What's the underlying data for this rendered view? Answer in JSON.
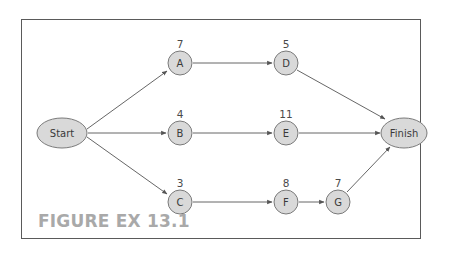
{
  "figure": {
    "caption": "FIGURE EX 13.1",
    "colors": {
      "node_fill": "#d9d9d9",
      "node_stroke": "#7a7a7a",
      "edge": "#555555",
      "caption": "#a9a9a9",
      "frame": "#5a5a5a"
    }
  },
  "nodes": [
    {
      "id": "start",
      "label": "Start",
      "shape": "ellipse",
      "duration": null
    },
    {
      "id": "A",
      "label": "A",
      "shape": "circle",
      "duration": "7"
    },
    {
      "id": "B",
      "label": "B",
      "shape": "circle",
      "duration": "4"
    },
    {
      "id": "C",
      "label": "C",
      "shape": "circle",
      "duration": "3"
    },
    {
      "id": "D",
      "label": "D",
      "shape": "circle",
      "duration": "5"
    },
    {
      "id": "E",
      "label": "E",
      "shape": "circle",
      "duration": "11"
    },
    {
      "id": "F",
      "label": "F",
      "shape": "circle",
      "duration": "8"
    },
    {
      "id": "G",
      "label": "G",
      "shape": "circle",
      "duration": "7"
    },
    {
      "id": "finish",
      "label": "Finish",
      "shape": "ellipse",
      "duration": null
    }
  ],
  "edges": [
    {
      "from": "Start",
      "to": "A"
    },
    {
      "from": "Start",
      "to": "B"
    },
    {
      "from": "Start",
      "to": "C"
    },
    {
      "from": "A",
      "to": "D"
    },
    {
      "from": "B",
      "to": "E"
    },
    {
      "from": "C",
      "to": "F"
    },
    {
      "from": "F",
      "to": "G"
    },
    {
      "from": "D",
      "to": "Finish"
    },
    {
      "from": "E",
      "to": "Finish"
    },
    {
      "from": "G",
      "to": "Finish"
    }
  ]
}
